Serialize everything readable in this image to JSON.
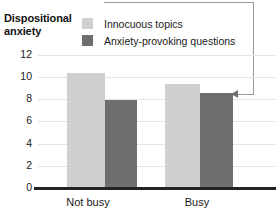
{
  "chart_data": {
    "type": "bar",
    "title": "Dispositional anxiety",
    "xlabel": "",
    "ylabel": "Dispositional anxiety",
    "categories": [
      "Not busy",
      "Busy"
    ],
    "series": [
      {
        "name": "Innocuous topics",
        "values": [
          10.4,
          9.4
        ],
        "color": "#cfcfcf"
      },
      {
        "name": "Anxiety-provoking questions",
        "values": [
          7.9,
          8.6
        ],
        "color": "#6e6e6e"
      }
    ],
    "ylim": [
      0,
      12
    ],
    "yticks": [
      "12",
      "10",
      "8",
      "6",
      "4",
      "2",
      "0"
    ],
    "grid": true,
    "legend_position": "top",
    "annotations": [
      {
        "name": "callout-leader",
        "target": "Busy / Anxiety-provoking questions",
        "text": ""
      }
    ]
  },
  "title": {
    "line1": "Dispositional",
    "line2": "anxiety"
  },
  "legend": {
    "items": [
      {
        "label": "Innocuous topics",
        "color": "#cfcfcf"
      },
      {
        "label": "Anxiety-provoking questions",
        "color": "#6e6e6e"
      }
    ]
  },
  "yaxis": {
    "ticks": [
      "12",
      "10",
      "8",
      "6",
      "4",
      "2",
      "0"
    ]
  },
  "xaxis": {
    "ticks": [
      "Not busy",
      "Busy"
    ]
  }
}
